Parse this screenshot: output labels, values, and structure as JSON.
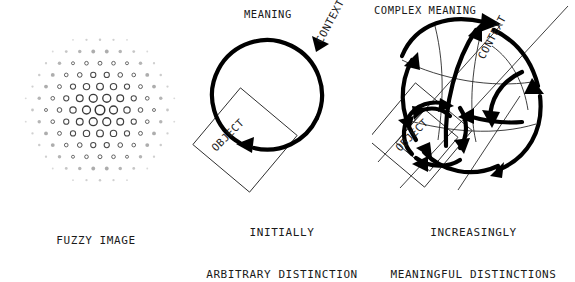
{
  "figure": {
    "background_color": "#ffffff",
    "ink_color": "#1a1a1a",
    "width": 575,
    "height": 241
  },
  "panels": [
    {
      "id": "fuzzy",
      "caption_lines": [
        "FUZZY IMAGE"
      ],
      "labels": [],
      "description": "radial hexagonal lattice of open circles, largest at centre fading to tiny dots at the rim"
    },
    {
      "id": "initial",
      "caption_lines": [
        "INITIALLY",
        "ARBITRARY DISTINCTION"
      ],
      "labels": [
        {
          "text": "MEANING",
          "rotation": 0
        },
        {
          "text": "CONTEXT",
          "rotation": -62
        },
        {
          "text": "OBJECT",
          "rotation": -45
        }
      ],
      "description": "one thick circular arrow with two arrowheads overlapping a thin tilted square"
    },
    {
      "id": "complex",
      "caption_lines": [
        "INCREASINGLY",
        "MEANINGFUL DISTINCTIONS"
      ],
      "labels": [
        {
          "text": "COMPLEX MEANING",
          "rotation": 0
        },
        {
          "text": "CONTEXT",
          "rotation": -62
        },
        {
          "text": "OBJECT",
          "rotation": -45
        }
      ],
      "description": "many thick curved arrows woven inside a circle with thin crossing lines and nested tilted squares"
    }
  ],
  "fuzzy_pattern": {
    "center_x": 100,
    "center_y": 110,
    "lattice_spacing": 13.5,
    "max_radius": 78,
    "max_circle_diameter": 11,
    "min_circle_diameter": 1.5
  },
  "initial_diagram": {
    "circle": {
      "cx": 83,
      "cy": 95,
      "r": 55,
      "stroke_width": 4.2
    },
    "square": {
      "cx": 53,
      "cy": 140,
      "size": 74,
      "rotation": 40,
      "stroke_width": 0.9
    },
    "label_meaning": {
      "x": 52,
      "y": 18
    },
    "label_context": {
      "x": 130,
      "y": 44
    },
    "label_object": {
      "x": 24,
      "y": 152
    }
  },
  "complex_diagram": {
    "circle": {
      "cx": 83,
      "cy": 105,
      "r": 76
    },
    "squares": [
      {
        "cx": 48,
        "cy": 135,
        "size": 74,
        "rotation": 40
      },
      {
        "cx": 55,
        "cy": 140,
        "size": 44,
        "rotation": 40
      }
    ],
    "label_complex_meaning": {
      "x": 2,
      "y": 14
    },
    "label_context": {
      "x": 112,
      "y": 60
    },
    "label_object": {
      "x": 28,
      "y": 152
    }
  }
}
